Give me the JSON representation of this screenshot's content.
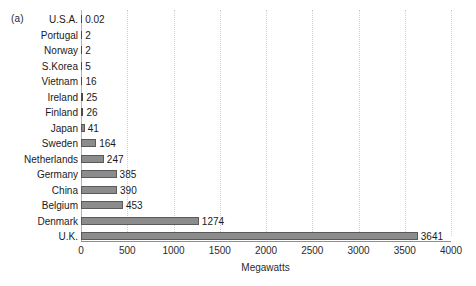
{
  "panel": {
    "label": "(a)"
  },
  "chart_data": {
    "type": "bar",
    "orientation": "horizontal",
    "title": "",
    "xlabel": "Megawatts",
    "ylabel": "",
    "xlim": [
      0,
      4000
    ],
    "grid": true,
    "legend": "none",
    "xticks": [
      0,
      500,
      1000,
      1500,
      2000,
      2500,
      3000,
      3500,
      4000
    ],
    "xtick_labels": [
      "0",
      "500",
      "1000",
      "1500",
      "2000",
      "2500",
      "3000",
      "3500",
      "4000"
    ],
    "categories": [
      "U.S.A.",
      "Portugal",
      "Norway",
      "S.Korea",
      "Vietnam",
      "Ireland",
      "Finland",
      "Japan",
      "Sweden",
      "Netherlands",
      "Germany",
      "China",
      "Belgium",
      "Denmark",
      "U.K."
    ],
    "values": [
      0.02,
      2,
      2,
      5,
      16,
      25,
      26,
      41,
      164,
      247,
      385,
      390,
      453,
      1274,
      3641
    ],
    "value_labels": [
      "0.02",
      "2",
      "2",
      "5",
      "16",
      "25",
      "26",
      "41",
      "164",
      "247",
      "385",
      "390",
      "453",
      "1274",
      "3641"
    ],
    "bar_color": "#8c8c8c",
    "bar_edge_color": "#5a5a5a",
    "grid_color": "#cfcfcf"
  }
}
